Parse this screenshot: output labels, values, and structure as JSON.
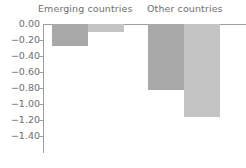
{
  "chart_data": {
    "type": "bar",
    "title": "",
    "subtitle": "",
    "xlabel": "",
    "ylabel": "",
    "categories": [
      "Emerging countries",
      "Other countries"
    ],
    "series": [
      {
        "name": "dark-series",
        "color": "#a8a8a8",
        "values": [
          -0.28,
          -0.82
        ]
      },
      {
        "name": "light-series",
        "color": "#c4c4c4",
        "values": [
          -0.1,
          -1.16
        ]
      }
    ],
    "ylim": [
      -1.4,
      0.0
    ],
    "ytick_values": [
      0.0,
      -0.2,
      -0.4,
      -0.6,
      -0.8,
      -1.0,
      -1.2,
      -1.4
    ],
    "ytick_labels": [
      "0.00",
      "−0.20",
      "−0.40",
      "−0.60",
      "−0.80",
      "−1.00",
      "−1.20",
      "−1.40"
    ],
    "grid": false,
    "legend": "none",
    "category_label_position": "top",
    "annotations": []
  },
  "style": {
    "background": "#ffffff",
    "text_color": "#6f6f6f",
    "axis_color": "#9e9e9e",
    "bar_dark": "#a8a8a8",
    "bar_light": "#c4c4c4"
  },
  "geometry": {
    "zero_y": 24,
    "px_per_unit": 80,
    "axis_x": 43,
    "bar_width": 36,
    "group_starts": [
      52,
      148
    ]
  }
}
